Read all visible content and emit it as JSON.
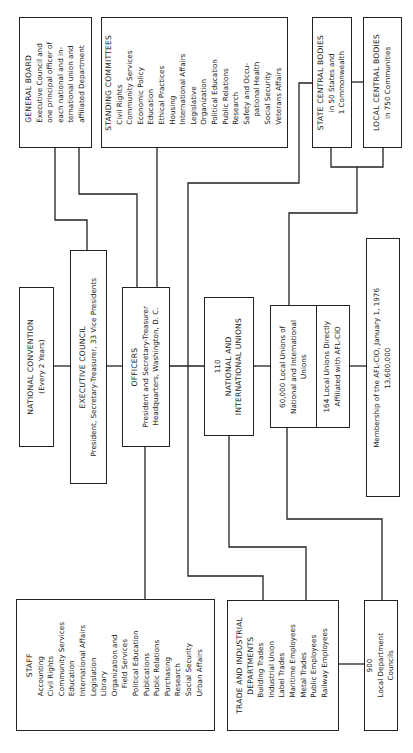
{
  "diagram": {
    "orientation": "rotated-90-ccw",
    "line_color": "#222222",
    "background": "#ffffff"
  },
  "nodes": {
    "general_board": {
      "title": "GENERAL BOARD",
      "lines": [
        "Executive Council and",
        "one principal officer of",
        "each national and in-",
        "ternational union and",
        "affiliated Department"
      ]
    },
    "standing_committees": {
      "title": "STANDING COMMITTEES",
      "items": [
        "Civil Rights",
        "Community Services",
        "Economic Policy",
        "Education",
        "Ethical Practices",
        "Housing",
        "International Affairs",
        "Legislative",
        "Organization",
        "Political Education",
        "Public Relations",
        "Research",
        "Safety and Occu-",
        "pational Health",
        "Social Security",
        "Veterans Affairs"
      ]
    },
    "state_central_bodies": {
      "title": "STATE CENTRAL BODIES",
      "lines": [
        "in 50 States and",
        "1 Commonwealth"
      ]
    },
    "local_central_bodies": {
      "title": "LOCAL CENTRAL BODIES",
      "lines": [
        "in 750 Communities"
      ]
    },
    "national_convention": {
      "title": "NATIONAL CONVENTION",
      "lines": [
        "(Every 2 Years)"
      ]
    },
    "executive_council": {
      "title": "EXECUTIVE COUNCIL",
      "lines": [
        "President, Secretary-Treasurer, 33 Vice Presidents"
      ]
    },
    "officers": {
      "title": "OFFICERS",
      "lines": [
        "President and Secretary-Treasurer",
        "Headquarters, Washington, D. C."
      ]
    },
    "national_international_unions": {
      "count": "110",
      "lines": [
        "NATIONAL AND",
        "INTERNATIONAL UNIONS"
      ]
    },
    "local_unions": {
      "lines": [
        "60,000 Local Unions of",
        "National and International",
        "Unions"
      ]
    },
    "directly_affiliated": {
      "lines": [
        "164 Local Unions Directly",
        "Affiliated with AFL-CIO"
      ]
    },
    "membership": {
      "lines": [
        "Membership of the AFL-CIO, January 1, 1976",
        "13,600,000"
      ]
    },
    "staff": {
      "title": "STAFF",
      "items": [
        "Accounting",
        "Civil Rights",
        "Community Services",
        "Education",
        "International Affairs",
        "Legislation",
        "Library",
        "Organization and",
        "Field Services",
        "Political Education",
        "Publications",
        "Public Relations",
        "Purchasing",
        "Research",
        "Social Security",
        "Urban Affairs"
      ]
    },
    "trade_industrial_departments": {
      "title_lines": [
        "TRADE AND INDUSTRIAL",
        "DEPARTMENTS"
      ],
      "items": [
        "Building Trades",
        "Industrial Union",
        "Label Trades",
        "Maritime Employees",
        "Metal Trades",
        "Public Employees",
        "Railway Employees"
      ]
    },
    "local_department_councils": {
      "count": "900",
      "lines": [
        "Local Department",
        "Councils"
      ]
    }
  }
}
